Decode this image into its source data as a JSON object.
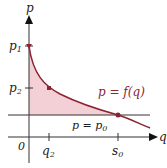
{
  "diagram": {
    "axes": {
      "x_label": "q",
      "y_label": "p",
      "origin_label": "0"
    },
    "y_ticks": [
      {
        "label": "p",
        "sub": "1"
      },
      {
        "label": "p",
        "sub": "2"
      }
    ],
    "x_ticks": [
      {
        "label": "q",
        "sub": "2"
      },
      {
        "label": "s",
        "sub": "0"
      }
    ],
    "curve_label": "p = f(q)",
    "line_label": {
      "main": "p = p",
      "sub": "0"
    },
    "colors": {
      "curve": "#8b2332",
      "shade": "#f3d0d5",
      "axes": "#333333",
      "line": "#333333"
    }
  }
}
